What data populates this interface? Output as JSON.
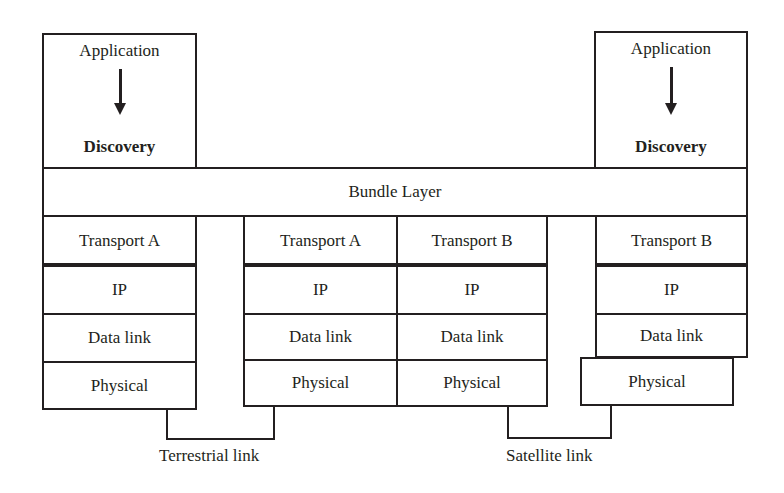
{
  "diagram": {
    "left_node": {
      "application_label": "Application",
      "discovery_label": "Discovery"
    },
    "right_node": {
      "application_label": "Application",
      "discovery_label": "Discovery"
    },
    "bundle_layer_label": "Bundle Layer",
    "stacks": [
      {
        "id": "left-host",
        "layers": [
          "Transport A",
          "IP",
          "Data link",
          "Physical"
        ]
      },
      {
        "id": "router-a",
        "layers": [
          "Transport A",
          "IP",
          "Data link",
          "Physical"
        ]
      },
      {
        "id": "router-b",
        "layers": [
          "Transport B",
          "IP",
          "Data link",
          "Physical"
        ]
      },
      {
        "id": "right-host",
        "layers": [
          "Transport B",
          "IP",
          "Data link",
          "Physical"
        ]
      }
    ],
    "links": [
      {
        "label": "Terrestrial link"
      },
      {
        "label": "Satellite link"
      }
    ],
    "line_color": "#231f20"
  }
}
